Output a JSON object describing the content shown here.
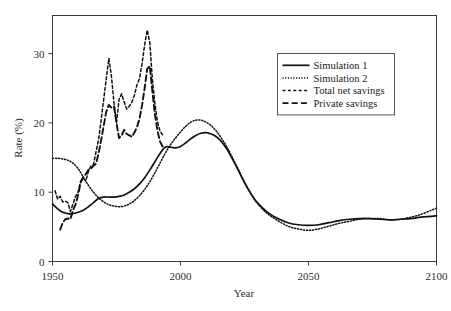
{
  "chart_data": {
    "type": "line",
    "title": "",
    "xlabel": "Year",
    "ylabel": "Rate (%)",
    "xlim": [
      1950,
      2100
    ],
    "ylim": [
      0,
      35.5
    ],
    "xticks": [
      1950,
      2000,
      2050,
      2100
    ],
    "yticks": [
      0,
      10,
      20,
      30
    ],
    "xtick_labels": [
      "1950",
      "2000",
      "2050",
      "2100"
    ],
    "ytick_labels": [
      "0",
      "10",
      "20",
      "30"
    ],
    "grid": false,
    "legend_position": "upper-right",
    "legend": [
      {
        "name": "Simulation 1",
        "style": "solid"
      },
      {
        "name": "Simulation 2",
        "style": "dotted"
      },
      {
        "name": "Total net savings",
        "style": "dashed"
      },
      {
        "name": "Private savings",
        "style": "long-dashed"
      }
    ],
    "series": [
      {
        "name": "Simulation 1",
        "style": "solid",
        "stroke_width": 1.7,
        "dasharray": "",
        "x": [
          1950,
          1952,
          1954,
          1956,
          1958,
          1960,
          1962,
          1964,
          1966,
          1968,
          1970,
          1972,
          1974,
          1976,
          1978,
          1980,
          1982,
          1984,
          1986,
          1988,
          1990,
          1992,
          1994,
          1996,
          1998,
          2000,
          2002,
          2004,
          2006,
          2008,
          2010,
          2012,
          2014,
          2016,
          2018,
          2020,
          2022,
          2024,
          2026,
          2028,
          2030,
          2034,
          2038,
          2042,
          2046,
          2050,
          2054,
          2058,
          2062,
          2066,
          2070,
          2074,
          2078,
          2082,
          2086,
          2090,
          2094,
          2098,
          2100
        ],
        "y": [
          8.3,
          7.6,
          7.1,
          6.9,
          6.9,
          7.1,
          7.4,
          7.9,
          8.5,
          9.1,
          9.3,
          9.3,
          9.3,
          9.4,
          9.6,
          10.0,
          10.5,
          11.2,
          12.1,
          13.2,
          14.4,
          15.6,
          16.5,
          16.5,
          16.4,
          16.6,
          17.1,
          17.7,
          18.2,
          18.5,
          18.6,
          18.4,
          18.0,
          17.3,
          16.3,
          15.0,
          13.6,
          12.1,
          10.7,
          9.5,
          8.5,
          7.1,
          6.2,
          5.6,
          5.3,
          5.2,
          5.3,
          5.6,
          5.9,
          6.1,
          6.2,
          6.2,
          6.1,
          6.0,
          6.1,
          6.2,
          6.4,
          6.5,
          6.6
        ]
      },
      {
        "name": "Simulation 2",
        "style": "dotted",
        "stroke_width": 1.5,
        "dasharray": "1.2 1.8",
        "x": [
          1950,
          1952,
          1954,
          1956,
          1958,
          1960,
          1962,
          1964,
          1966,
          1968,
          1970,
          1972,
          1974,
          1976,
          1978,
          1980,
          1982,
          1984,
          1986,
          1988,
          1990,
          1992,
          1994,
          1996,
          1998,
          2000,
          2002,
          2004,
          2006,
          2008,
          2010,
          2012,
          2014,
          2016,
          2018,
          2020,
          2022,
          2024,
          2026,
          2028,
          2030,
          2034,
          2038,
          2042,
          2046,
          2050,
          2054,
          2058,
          2062,
          2066,
          2070,
          2074,
          2078,
          2082,
          2086,
          2090,
          2094,
          2098,
          2100
        ],
        "y": [
          14.9,
          14.9,
          14.8,
          14.6,
          14.2,
          13.4,
          12.2,
          11.0,
          10.0,
          9.2,
          8.6,
          8.2,
          8.0,
          7.9,
          8.0,
          8.3,
          8.8,
          9.5,
          10.4,
          11.5,
          12.8,
          14.2,
          15.6,
          16.8,
          17.8,
          18.7,
          19.5,
          20.1,
          20.4,
          20.4,
          20.1,
          19.6,
          18.8,
          17.8,
          16.6,
          15.2,
          13.7,
          12.2,
          10.8,
          9.5,
          8.4,
          6.9,
          5.9,
          5.1,
          4.7,
          4.5,
          4.7,
          5.1,
          5.5,
          5.8,
          6.1,
          6.2,
          6.2,
          6.0,
          6.1,
          6.4,
          6.8,
          7.4,
          7.7
        ]
      },
      {
        "name": "Total net savings",
        "style": "dashed",
        "stroke_width": 1.5,
        "dasharray": "3 2.4",
        "x": [
          1951,
          1952,
          1953,
          1954,
          1955,
          1956,
          1957,
          1958,
          1959,
          1960,
          1961,
          1962,
          1963,
          1964,
          1965,
          1966,
          1967,
          1968,
          1969,
          1970,
          1971,
          1972,
          1973,
          1974,
          1975,
          1976,
          1977,
          1978,
          1979,
          1980,
          1981,
          1982,
          1983,
          1984,
          1985,
          1986,
          1987,
          1988,
          1989,
          1990,
          1991,
          1992,
          1993
        ],
        "y": [
          10.2,
          9.0,
          9.4,
          8.6,
          8.7,
          8.5,
          7.2,
          8.3,
          9.4,
          10.0,
          11.6,
          12.0,
          11.6,
          13.0,
          13.8,
          14.0,
          15.8,
          17.6,
          20.4,
          23.4,
          26.4,
          29.3,
          26.8,
          23.0,
          20.0,
          23.4,
          24.2,
          23.0,
          22.0,
          22.4,
          23.0,
          24.0,
          25.5,
          26.4,
          28.6,
          31.3,
          33.4,
          31.6,
          26.4,
          22.8,
          20.2,
          18.8,
          18.3
        ]
      },
      {
        "name": "Private savings",
        "style": "long-dashed",
        "stroke_width": 1.9,
        "dasharray": "6 3.2",
        "x": [
          1953,
          1954,
          1955,
          1956,
          1957,
          1958,
          1959,
          1960,
          1961,
          1962,
          1963,
          1964,
          1965,
          1966,
          1967,
          1968,
          1969,
          1970,
          1971,
          1972,
          1973,
          1974,
          1975,
          1976,
          1977,
          1978,
          1979,
          1980,
          1981,
          1982,
          1983,
          1984,
          1985,
          1986,
          1987,
          1988,
          1989,
          1990,
          1991,
          1992,
          1993
        ],
        "y": [
          4.6,
          5.6,
          6.1,
          6.2,
          6.1,
          7.4,
          8.2,
          9.6,
          11.4,
          12.2,
          12.6,
          13.2,
          13.4,
          13.8,
          14.1,
          15.6,
          17.5,
          19.6,
          21.6,
          22.6,
          22.2,
          22.4,
          20.0,
          17.8,
          18.2,
          19.0,
          18.4,
          18.2,
          18.0,
          18.6,
          19.4,
          20.6,
          22.6,
          25.0,
          27.8,
          28.2,
          24.6,
          21.2,
          18.9,
          17.3,
          16.6
        ]
      }
    ]
  },
  "figure": {
    "background_color": "#ffffff",
    "line_color": "#111111",
    "axis_color": "#3a3a3a"
  }
}
